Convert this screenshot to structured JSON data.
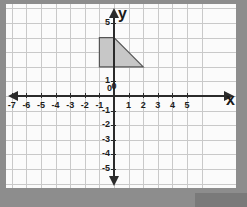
{
  "diagram": {
    "axis_labels": {
      "x": "x",
      "y": "y"
    },
    "origin_label": "0",
    "x_ticks": [
      {
        "value": -7,
        "label": "-7"
      },
      {
        "value": -6,
        "label": "-6"
      },
      {
        "value": -5,
        "label": "-5"
      },
      {
        "value": -4,
        "label": "-4"
      },
      {
        "value": -3,
        "label": "-3"
      },
      {
        "value": -2,
        "label": "-2"
      },
      {
        "value": -1,
        "label": "-1"
      },
      {
        "value": 0,
        "label": "0"
      },
      {
        "value": 1,
        "label": "1"
      },
      {
        "value": 2,
        "label": "2"
      },
      {
        "value": 3,
        "label": "3"
      },
      {
        "value": 4,
        "label": "4"
      },
      {
        "value": 5,
        "label": "5"
      }
    ],
    "y_ticks": [
      {
        "value": 5,
        "label": "5"
      },
      {
        "value": 1,
        "label": "1"
      },
      {
        "value": 0,
        "label": "0"
      },
      {
        "value": -1,
        "label": "-1"
      },
      {
        "value": -2,
        "label": "-2"
      },
      {
        "value": -3,
        "label": "-3"
      },
      {
        "value": -4,
        "label": "-4"
      },
      {
        "value": -5,
        "label": "-5"
      }
    ],
    "x_range": [
      -8,
      6
    ],
    "y_range": [
      -6,
      6
    ],
    "grid": true,
    "shape": {
      "name": "trapezoid",
      "vertices": [
        {
          "x": -1,
          "y": 4
        },
        {
          "x": 0,
          "y": 4
        },
        {
          "x": 2,
          "y": 2
        },
        {
          "x": -1,
          "y": 2
        }
      ],
      "fill_color": "#c7c7c7",
      "stroke_color": "#555555"
    },
    "colors": {
      "background": "#8d8d8d",
      "panel": "#fbfbfb",
      "gridline": "#c9c9c9",
      "axis": "#2b2b2b",
      "text": "#1c1c1c"
    }
  }
}
